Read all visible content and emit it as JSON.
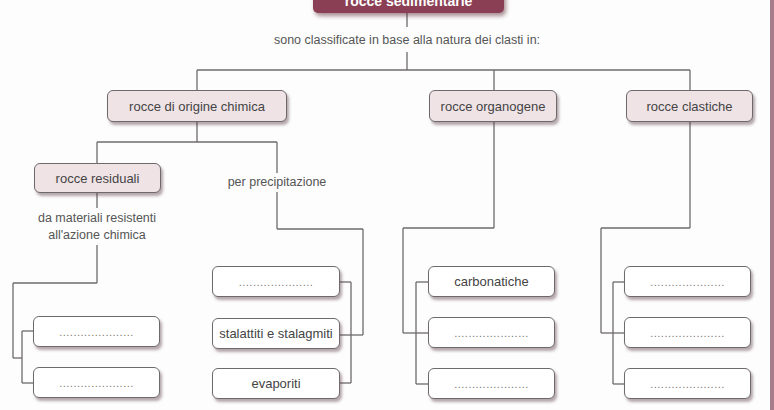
{
  "diagram": {
    "title": "rocce sedimentarie",
    "subtitle": "sono classificate in base alla natura dei clasti in:",
    "categories": [
      {
        "label": "rocce di origine chimica",
        "branches": [
          {
            "label": "rocce residuali",
            "description": "da materiali resistenti all'azione chimica",
            "description_line1": "da materiali resistenti",
            "description_line2": "all'azione chimica",
            "children": [
              ".....................",
              "....................."
            ]
          },
          {
            "label": "per precipitazione",
            "children": [
              ".....................",
              "stalattiti e stalagmiti",
              "evaporiti"
            ]
          }
        ]
      },
      {
        "label": "rocce organogene",
        "children": [
          "carbonatiche",
          ".....................",
          "....................."
        ]
      },
      {
        "label": "rocce clastiche",
        "children": [
          ".....................",
          ".....................",
          "....................."
        ]
      }
    ]
  },
  "colors": {
    "title_fill": "#8b3f55",
    "node_fill": "#efe3e6",
    "line": "#6e6a6c",
    "edge_strip": "#a87d8b"
  }
}
